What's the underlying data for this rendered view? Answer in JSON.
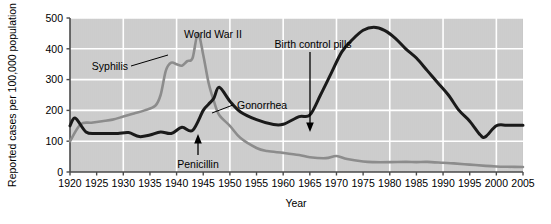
{
  "chart_data": {
    "type": "line",
    "title": "",
    "xlabel": "Year",
    "ylabel": "Reported cases per 100,000 population",
    "xlim": [
      1920,
      2005
    ],
    "ylim": [
      0,
      500
    ],
    "xticks": [
      1920,
      1925,
      1930,
      1935,
      1940,
      1945,
      1950,
      1955,
      1960,
      1965,
      1970,
      1975,
      1980,
      1985,
      1990,
      1995,
      2000,
      2005
    ],
    "yticks": [
      0,
      100,
      200,
      300,
      400,
      500
    ],
    "grid": true,
    "legend_position": "inline-annotations",
    "plot_background": "#c9c9c9",
    "gridline_color": "#ffffff",
    "series": [
      {
        "name": "Syphilis",
        "color": "#8c8c8c",
        "x": [
          1920,
          1922,
          1924,
          1926,
          1928,
          1930,
          1932,
          1934,
          1936,
          1937,
          1938,
          1939,
          1940,
          1941,
          1942,
          1943,
          1944,
          1945,
          1946,
          1947,
          1948,
          1950,
          1952,
          1955,
          1957,
          1960,
          1963,
          1965,
          1968,
          1970,
          1972,
          1975,
          1977,
          1980,
          1983,
          1985,
          1987,
          1990,
          1992,
          1995,
          1998,
          2000,
          2002,
          2005
        ],
        "values": [
          100,
          155,
          160,
          165,
          170,
          180,
          190,
          200,
          215,
          250,
          330,
          355,
          350,
          345,
          360,
          370,
          450,
          380,
          290,
          230,
          185,
          150,
          110,
          78,
          68,
          62,
          55,
          48,
          45,
          52,
          42,
          34,
          32,
          32,
          33,
          32,
          33,
          30,
          28,
          24,
          20,
          18,
          17,
          16
        ]
      },
      {
        "name": "Gonorrhea",
        "color": "#1a1a1a",
        "x": [
          1920,
          1921,
          1923,
          1925,
          1927,
          1929,
          1931,
          1933,
          1935,
          1937,
          1939,
          1941,
          1943,
          1945,
          1946,
          1947,
          1948,
          1950,
          1952,
          1955,
          1958,
          1960,
          1963,
          1965,
          1967,
          1969,
          1971,
          1973,
          1975,
          1977,
          1979,
          1981,
          1983,
          1985,
          1987,
          1989,
          1991,
          1993,
          1995,
          1997,
          1998,
          2000,
          2002,
          2005
        ],
        "values": [
          150,
          175,
          130,
          125,
          125,
          125,
          128,
          115,
          120,
          130,
          125,
          145,
          135,
          200,
          220,
          240,
          275,
          230,
          195,
          170,
          155,
          155,
          180,
          185,
          250,
          320,
          390,
          430,
          460,
          470,
          460,
          435,
          400,
          370,
          330,
          290,
          250,
          200,
          165,
          120,
          115,
          150,
          152,
          152
        ]
      }
    ],
    "annotations": [
      {
        "name": "syphilis-label",
        "text": "Syphilis",
        "x": 1930.5,
        "y": 410,
        "leader": true
      },
      {
        "name": "world-war-ii-label",
        "text": "World War II",
        "x": 1942.5,
        "y": 490,
        "leader": false
      },
      {
        "name": "birth-control-pills-label",
        "text": "Birth control pills",
        "x": 1966,
        "y": 455,
        "leader": true
      },
      {
        "name": "gonorrhea-label",
        "text": "Gonorrhea",
        "x": 1955,
        "y": 252,
        "leader": true
      },
      {
        "name": "penicillin-label",
        "text": "Penicillin",
        "x": 1943,
        "y": 48,
        "leader": true
      }
    ]
  },
  "axis": {
    "y_title": "Reported cases per 100,000 population",
    "x_title": "Year",
    "y_tick_labels": [
      "500",
      "400",
      "300",
      "200",
      "100",
      "0"
    ],
    "x_tick_labels": [
      "1920",
      "1925",
      "1930",
      "1935",
      "1940",
      "1945",
      "1950",
      "1955",
      "1960",
      "1965",
      "1970",
      "1975",
      "1980",
      "1985",
      "1990",
      "1995",
      "2000",
      "2005"
    ]
  },
  "annotations": {
    "syphilis": "Syphilis",
    "world_war_ii": "World War II",
    "birth_control_pills": "Birth control pills",
    "gonorrhea": "Gonorrhea",
    "penicillin": "Penicillin"
  },
  "colors": {
    "syphilis_line": "#8c8c8c",
    "gonorrhea_line": "#1a1a1a",
    "plot_bg": "#c9c9c9",
    "grid": "#ffffff",
    "axis": "#4a4a4a"
  }
}
